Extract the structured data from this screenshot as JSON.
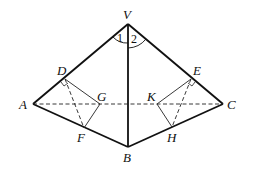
{
  "diagram": {
    "points": {
      "V": {
        "label": "V",
        "x": 128,
        "y": 24
      },
      "A": {
        "label": "A",
        "x": 33,
        "y": 104
      },
      "B": {
        "label": "B",
        "x": 128,
        "y": 147
      },
      "C": {
        "label": "C",
        "x": 223,
        "y": 104
      },
      "D": {
        "label": "D",
        "x": 65,
        "y": 79
      },
      "E": {
        "label": "E",
        "x": 191,
        "y": 79
      },
      "F": {
        "label": "F",
        "x": 84,
        "y": 128
      },
      "G": {
        "label": "G",
        "x": 100,
        "y": 104
      },
      "H": {
        "label": "H",
        "x": 172,
        "y": 127
      },
      "K": {
        "label": "K",
        "x": 157,
        "y": 104
      }
    },
    "angles": {
      "one": "1",
      "two": "2"
    },
    "solid_edges": [
      "VA",
      "VC",
      "VB",
      "AB",
      "BC"
    ],
    "dashed_edges": [
      "AC",
      "DF",
      "DG",
      "GF",
      "EH",
      "EK",
      "KH"
    ]
  }
}
